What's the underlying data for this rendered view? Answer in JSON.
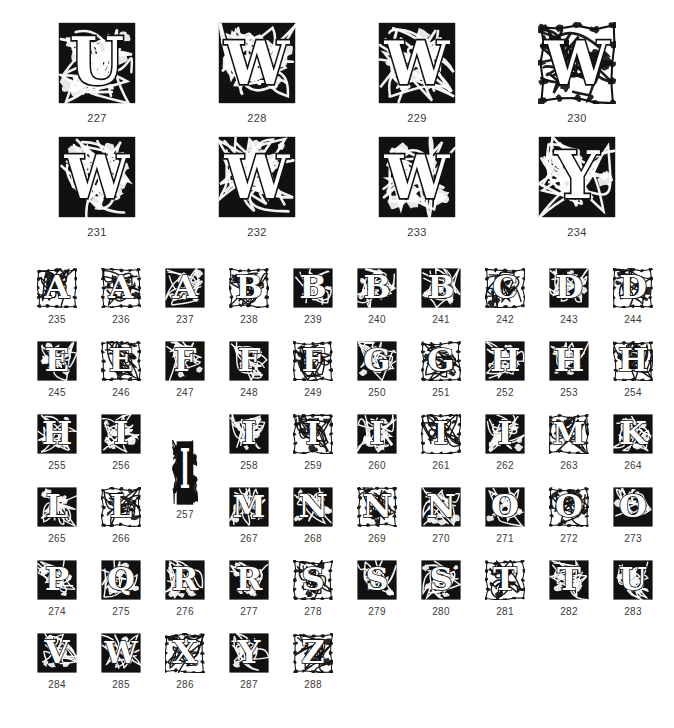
{
  "page": {
    "background_color": "#ffffff",
    "ink_color": "#111111",
    "caption_color": "#3a3a3a"
  },
  "large_section": {
    "rows": [
      [
        {
          "number": "227",
          "letter": "U",
          "style": "foliate-black-ground"
        },
        {
          "number": "228",
          "letter": "W",
          "style": "foliate-black-ground"
        },
        {
          "number": "229",
          "letter": "W",
          "style": "foliate-black-ground"
        },
        {
          "number": "230",
          "letter": "W",
          "style": "foliate-white-ground"
        }
      ],
      [
        {
          "number": "231",
          "letter": "W",
          "style": "foliate-black-ground"
        },
        {
          "number": "232",
          "letter": "W",
          "style": "foliate-black-ground"
        },
        {
          "number": "233",
          "letter": "W",
          "style": "foliate-black-ground"
        },
        {
          "number": "234",
          "letter": "Y",
          "style": "foliate-black-ground"
        }
      ]
    ]
  },
  "small_section": {
    "rows": [
      [
        {
          "number": "235",
          "letter": "A",
          "style": "outline-foliate"
        },
        {
          "number": "236",
          "letter": "A",
          "style": "outline-foliate"
        },
        {
          "number": "237",
          "letter": "A",
          "style": "black-ground"
        },
        {
          "number": "238",
          "letter": "B",
          "style": "outline-foliate"
        },
        {
          "number": "239",
          "letter": "B",
          "style": "black-ground"
        },
        {
          "number": "240",
          "letter": "B",
          "style": "black-ground"
        },
        {
          "number": "241",
          "letter": "B",
          "style": "black-ground"
        },
        {
          "number": "242",
          "letter": "C",
          "style": "outline-foliate"
        },
        {
          "number": "243",
          "letter": "D",
          "style": "black-ground"
        },
        {
          "number": "244",
          "letter": "D",
          "style": "outline-foliate"
        }
      ],
      [
        {
          "number": "245",
          "letter": "E",
          "style": "black-ground"
        },
        {
          "number": "246",
          "letter": "E",
          "style": "outline-foliate"
        },
        {
          "number": "247",
          "letter": "F",
          "style": "black-ground"
        },
        {
          "number": "248",
          "letter": "F",
          "style": "black-ground"
        },
        {
          "number": "249",
          "letter": "F",
          "style": "outline-foliate"
        },
        {
          "number": "250",
          "letter": "G",
          "style": "black-ground"
        },
        {
          "number": "251",
          "letter": "G",
          "style": "outline-foliate"
        },
        {
          "number": "252",
          "letter": "H",
          "style": "black-ground"
        },
        {
          "number": "253",
          "letter": "H",
          "style": "black-ground"
        },
        {
          "number": "254",
          "letter": "H",
          "style": "outline-foliate"
        }
      ],
      [
        {
          "number": "255",
          "letter": "H",
          "style": "black-ground"
        },
        {
          "number": "256",
          "letter": "I",
          "style": "black-ground"
        },
        {
          "number": "257",
          "letter": "I",
          "style": "tall-narrow",
          "tall": true
        },
        {
          "number": "258",
          "letter": "I",
          "style": "black-ground"
        },
        {
          "number": "259",
          "letter": "I",
          "style": "outline-foliate"
        },
        {
          "number": "260",
          "letter": "I",
          "style": "black-ground"
        },
        {
          "number": "261",
          "letter": "I",
          "style": "outline-foliate"
        },
        {
          "number": "262",
          "letter": "I",
          "style": "black-ground"
        },
        {
          "number": "263",
          "letter": "M",
          "style": "outline-foliate"
        },
        {
          "number": "264",
          "letter": "K",
          "style": "black-ground"
        }
      ],
      [
        {
          "number": "265",
          "letter": "L",
          "style": "black-ground"
        },
        {
          "number": "266",
          "letter": "L",
          "style": "outline-foliate"
        },
        {
          "number": "",
          "letter": "",
          "style": "blank",
          "blank": true
        },
        {
          "number": "267",
          "letter": "M",
          "style": "black-ground"
        },
        {
          "number": "268",
          "letter": "N",
          "style": "black-ground"
        },
        {
          "number": "269",
          "letter": "N",
          "style": "outline-foliate"
        },
        {
          "number": "270",
          "letter": "N",
          "style": "black-ground"
        },
        {
          "number": "271",
          "letter": "O",
          "style": "black-ground"
        },
        {
          "number": "272",
          "letter": "O",
          "style": "outline-foliate"
        },
        {
          "number": "273",
          "letter": "O",
          "style": "black-ground"
        }
      ],
      [
        {
          "number": "274",
          "letter": "P",
          "style": "black-ground"
        },
        {
          "number": "275",
          "letter": "Q",
          "style": "black-ground"
        },
        {
          "number": "276",
          "letter": "R",
          "style": "black-ground"
        },
        {
          "number": "277",
          "letter": "R",
          "style": "black-ground"
        },
        {
          "number": "278",
          "letter": "S",
          "style": "outline-foliate"
        },
        {
          "number": "279",
          "letter": "S",
          "style": "black-ground"
        },
        {
          "number": "280",
          "letter": "S",
          "style": "black-ground"
        },
        {
          "number": "281",
          "letter": "T",
          "style": "outline-foliate"
        },
        {
          "number": "282",
          "letter": "T",
          "style": "black-ground"
        },
        {
          "number": "283",
          "letter": "U",
          "style": "black-ground"
        }
      ],
      [
        {
          "number": "284",
          "letter": "V",
          "style": "black-ground"
        },
        {
          "number": "285",
          "letter": "W",
          "style": "black-ground"
        },
        {
          "number": "286",
          "letter": "X",
          "style": "outline-foliate"
        },
        {
          "number": "287",
          "letter": "Y",
          "style": "black-ground"
        },
        {
          "number": "288",
          "letter": "Z",
          "style": "outline-foliate"
        }
      ]
    ]
  }
}
